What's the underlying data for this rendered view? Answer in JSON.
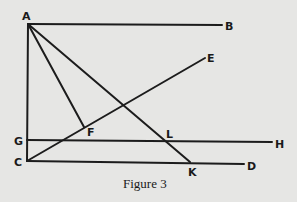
{
  "figure": {
    "caption": "Figure 3",
    "points": {
      "A": {
        "label": "A",
        "x": 28,
        "y": 24
      },
      "B": {
        "label": "B",
        "x": 223,
        "y": 25
      },
      "C": {
        "label": "C",
        "x": 27,
        "y": 161
      },
      "D": {
        "label": "D",
        "x": 245,
        "y": 164
      },
      "E": {
        "label": "E",
        "x": 207,
        "y": 57
      },
      "F": {
        "label": "F",
        "x": 84,
        "y": 127
      },
      "G": {
        "label": "G",
        "x": 27,
        "y": 140
      },
      "H": {
        "label": "H",
        "x": 273,
        "y": 142
      },
      "K": {
        "label": "K",
        "x": 190,
        "y": 162
      },
      "L": {
        "label": "L",
        "x": 165,
        "y": 142
      }
    },
    "segments": [
      "AB",
      "AC",
      "AF",
      "AK",
      "CE",
      "GH",
      "CD"
    ]
  }
}
